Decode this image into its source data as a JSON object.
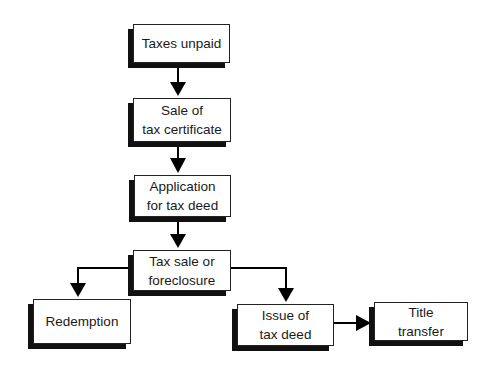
{
  "diagram": {
    "type": "flowchart",
    "nodes": [
      {
        "id": "taxes-unpaid",
        "label": "Taxes unpaid"
      },
      {
        "id": "sale-of-tax-certificate",
        "label": "Sale of\ntax certificate"
      },
      {
        "id": "application-for-tax-deed",
        "label": "Application\nfor tax deed"
      },
      {
        "id": "tax-sale-or-foreclosure",
        "label": "Tax sale or\nforeclosure"
      },
      {
        "id": "redemption",
        "label": "Redemption"
      },
      {
        "id": "issue-of-tax-deed",
        "label": "Issue of\ntax deed"
      },
      {
        "id": "title-transfer",
        "label": "Title\ntransfer"
      }
    ],
    "edges": [
      {
        "from": "taxes-unpaid",
        "to": "sale-of-tax-certificate"
      },
      {
        "from": "sale-of-tax-certificate",
        "to": "application-for-tax-deed"
      },
      {
        "from": "application-for-tax-deed",
        "to": "tax-sale-or-foreclosure"
      },
      {
        "from": "tax-sale-or-foreclosure",
        "to": "redemption"
      },
      {
        "from": "tax-sale-or-foreclosure",
        "to": "issue-of-tax-deed"
      },
      {
        "from": "issue-of-tax-deed",
        "to": "title-transfer"
      }
    ],
    "colors": {
      "border": "#222222",
      "shadow": "#111111",
      "text": "#1a1a1a",
      "background": "#ffffff",
      "arrow": "#000000"
    }
  }
}
